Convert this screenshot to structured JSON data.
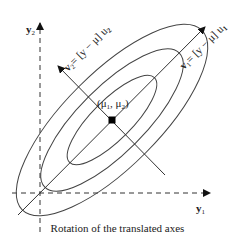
{
  "diagram": {
    "caption": "Rotation of the translated axes",
    "axes": {
      "y1": {
        "label": "y",
        "subscript": "1"
      },
      "y2": {
        "label": "y",
        "subscript": "2"
      }
    },
    "rotated_axes": {
      "v1": {
        "label": "v",
        "subscript": "1",
        "expr": "= [y − μ] u",
        "expr_subscript": "1"
      },
      "v2": {
        "label": "v",
        "subscript": "2",
        "expr": "= [y − μ] u",
        "expr_subscript": "2"
      }
    },
    "center": {
      "label": "(μ",
      "sub1": "1",
      "mid": ", μ",
      "sub2": "2",
      "close": ")"
    },
    "ellipse_count": 3,
    "colors": {
      "line": "#444444",
      "point": "#000000"
    }
  }
}
